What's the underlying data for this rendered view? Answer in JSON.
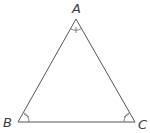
{
  "diagram": {
    "type": "triangle",
    "stroke_color": "#555555",
    "label_color": "#3a3a3a",
    "vertices": [
      {
        "name": "A",
        "x": 76,
        "y": 19,
        "label": "A",
        "label_x": 72,
        "label_y": 13
      },
      {
        "name": "B",
        "x": 18,
        "y": 122,
        "label": "B",
        "label_x": 3,
        "label_y": 127
      },
      {
        "name": "C",
        "x": 135,
        "y": 122,
        "label": "C",
        "label_x": 138,
        "label_y": 129
      }
    ],
    "angle_marks": [
      {
        "vertex": "A",
        "ticks": 1
      },
      {
        "vertex": "B",
        "ticks": 1
      },
      {
        "vertex": "C",
        "ticks": 1
      }
    ]
  }
}
